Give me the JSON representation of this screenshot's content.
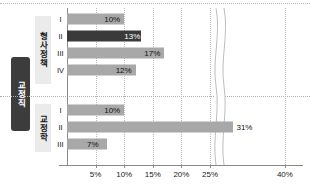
{
  "chart_data": {
    "type": "bar",
    "orientation": "horizontal",
    "title": "",
    "xlabel": "",
    "ylabel": "",
    "xlim": [
      0,
      42
    ],
    "grid": "vertical-dotted",
    "legend": "none",
    "axis_break": {
      "present": true,
      "from": 26,
      "to": 30
    },
    "xticks": [
      "5%",
      "10%",
      "15%",
      "20%",
      "25%",
      "40%"
    ],
    "xtick_values": [
      5,
      10,
      15,
      20,
      25,
      40
    ],
    "outer_category": "교정직",
    "groups": [
      {
        "label": "형사정책",
        "categories": [
          "I",
          "II",
          "III",
          "IV"
        ],
        "values": [
          10,
          13,
          17,
          12
        ],
        "value_labels": [
          "10%",
          "13%",
          "17%",
          "12%"
        ],
        "highlight_index": 1
      },
      {
        "label": "교정학",
        "categories": [
          "I",
          "II",
          "III"
        ],
        "values": [
          10,
          31,
          7
        ],
        "value_labels": [
          "10%",
          "31%",
          "7%"
        ],
        "highlight_index": -1
      }
    ],
    "colors": {
      "bar": "#a8a8a8",
      "bar_highlight": "#3a3a3a",
      "outer_label_bg": "#3c3c3c",
      "outer_label_text": "#ffffff",
      "group_label_bg": "#ebebeb",
      "axis": "#8a8a8a",
      "gridline": "#bdbdbd",
      "text": "#111111"
    }
  }
}
